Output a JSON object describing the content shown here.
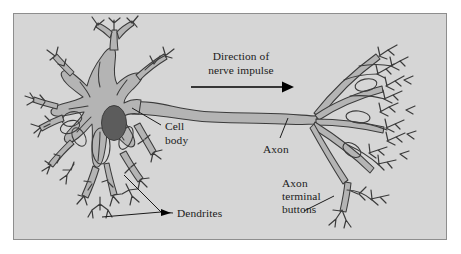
{
  "figure": {
    "kind": "neuron-anatomy-diagram",
    "cropped_caption_remnant": "",
    "panel": {
      "background_color": "#d6d6d6",
      "border_color": "#8e8e8e",
      "x": 13,
      "y": 13,
      "width": 434,
      "height": 227
    },
    "colors": {
      "cytoplasm": "#b4b4b4",
      "outline": "#3b3b3b",
      "nucleus": "#5c5c5c",
      "text": "#1b1b1b",
      "arrow": "#000000"
    },
    "labels": {
      "direction_line1": "Direction of",
      "direction_line2": "nerve impulse",
      "cell_body_line1": "Cell",
      "cell_body_line2": "body",
      "axon": "Axon",
      "dendrites": "Dendrites",
      "axon_terminal_line1": "Axon",
      "axon_terminal_line2": "terminal",
      "axon_terminal_line3": "buttons"
    },
    "parts": [
      {
        "name": "cell-body",
        "description": "soma with nucleus at left"
      },
      {
        "name": "nucleus",
        "description": "dark ellipse inside soma"
      },
      {
        "name": "dendrites",
        "description": "branching processes radiating from soma"
      },
      {
        "name": "axon",
        "description": "long tapering process running left to right"
      },
      {
        "name": "axon-terminal-buttons",
        "description": "terminal arborization at right"
      }
    ],
    "arrow": {
      "name": "nerve-impulse-arrow",
      "direction": "left-to-right",
      "x1": 190,
      "x2": 289,
      "y": 99
    }
  }
}
